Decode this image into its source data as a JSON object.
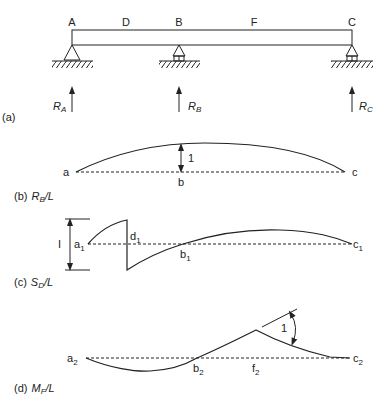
{
  "figure": {
    "panel_a": {
      "caption": "(a)",
      "points": {
        "A": "A",
        "D": "D",
        "B": "B",
        "F": "F",
        "C": "C"
      },
      "reactions": [
        {
          "main": "R",
          "sub": "A"
        },
        {
          "main": "R",
          "sub": "B"
        },
        {
          "main": "R",
          "sub": "C"
        }
      ]
    },
    "panel_b": {
      "caption_prefix": "(b)",
      "caption_main": "R",
      "caption_sub": "B",
      "caption_suffix": "/L",
      "labels": {
        "a": "a",
        "b": "b",
        "c": "c",
        "ordinate": "1"
      }
    },
    "panel_c": {
      "caption_prefix": "(c)",
      "caption_main": "S",
      "caption_sub": "D",
      "caption_suffix": "/L",
      "labels": {
        "a": "a",
        "a_sub": "1",
        "d": "d",
        "d_sub": "1",
        "b": "b",
        "b_sub": "1",
        "c": "c",
        "c_sub": "1",
        "jump": "I"
      }
    },
    "panel_d": {
      "caption_prefix": "(d)",
      "caption_main": "M",
      "caption_sub": "F",
      "caption_suffix": "/L",
      "labels": {
        "a": "a",
        "a_sub": "2",
        "b": "b",
        "b_sub": "2",
        "f": "f",
        "f_sub": "2",
        "c": "c",
        "c_sub": "2",
        "angle": "1"
      }
    }
  },
  "colors": {
    "ink": "#222222",
    "background": "#ffffff"
  }
}
